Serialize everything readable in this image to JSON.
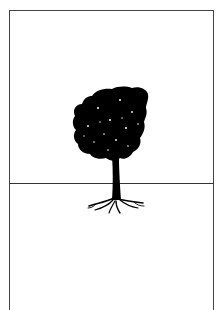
{
  "illustration": {
    "subject": "tree-above-and-below-ground",
    "colors": {
      "ink": "#000000",
      "frame": "#444444",
      "background": "#ffffff"
    }
  }
}
